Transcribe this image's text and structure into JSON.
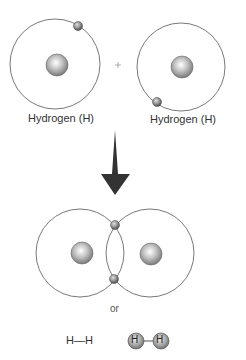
{
  "diagram": {
    "atoms": [
      {
        "label": "Hydrogen (H)",
        "nucleus": [
          57,
          65
        ],
        "orbit_radius": 45,
        "electron": [
          78,
          25
        ]
      },
      {
        "label": "Hydrogen (H)",
        "nucleus": [
          182,
          67
        ],
        "orbit_radius": 44,
        "electron": [
          157,
          102
        ]
      }
    ],
    "plus_sign": "+",
    "arrow": {
      "direction": "down"
    },
    "molecule": {
      "nuclei": [
        [
          82,
          253
        ],
        [
          151,
          254
        ]
      ],
      "shared_electrons": [
        [
          115,
          225
        ],
        [
          114,
          279
        ]
      ]
    },
    "or_label": "or",
    "structural_formula": "H—H",
    "ball_model": {
      "atom_label": "H"
    },
    "colors": {
      "line": "#555555",
      "nucleus": "#a8a8a8",
      "electron": "#888888",
      "arrow": "#333333",
      "text": "#333333"
    }
  }
}
